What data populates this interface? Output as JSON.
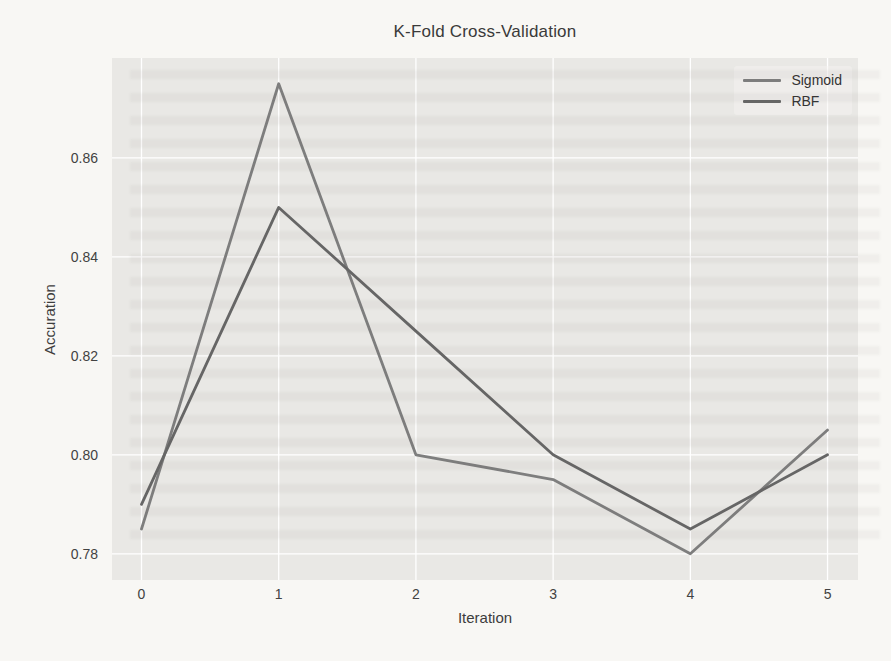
{
  "chart_data": {
    "type": "line",
    "title": "K-Fold Cross-Validation",
    "xlabel": "Iteration",
    "ylabel": "Accuration",
    "x": [
      0,
      1,
      2,
      3,
      4,
      5
    ],
    "series": [
      {
        "name": "Sigmoid",
        "color": "#7e7e7e",
        "values": [
          0.785,
          0.875,
          0.8,
          0.795,
          0.78,
          0.805
        ]
      },
      {
        "name": "RBF",
        "color": "#666666",
        "values": [
          0.79,
          0.85,
          0.825,
          0.8,
          0.785,
          0.8
        ]
      }
    ],
    "xticks": [
      0,
      1,
      2,
      3,
      4,
      5
    ],
    "xtick_labels": [
      "0",
      "1",
      "2",
      "3",
      "4",
      "5"
    ],
    "yticks": [
      0.78,
      0.8,
      0.82,
      0.84,
      0.86
    ],
    "ytick_labels": [
      "0.78",
      "0.80",
      "0.82",
      "0.84",
      "0.86"
    ],
    "xlim": [
      -0.215,
      5.222
    ],
    "ylim": [
      0.7747,
      0.8802
    ],
    "grid": true,
    "grid_color": "#ffffff",
    "plot_background": "#e9e8e5",
    "page_background": "#f8f7f4",
    "legend_position": "upper right"
  }
}
